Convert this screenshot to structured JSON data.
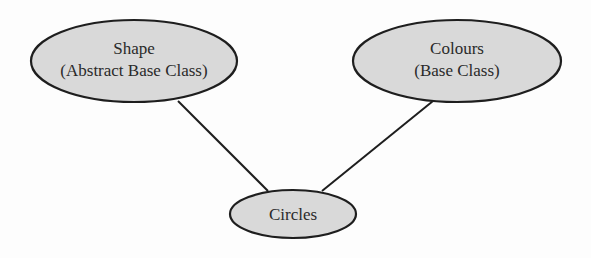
{
  "diagram": {
    "type": "class-inheritance",
    "colors": {
      "background": "#fdfdfd",
      "node_fill": "#d9d9d9",
      "node_stroke": "#1e1e1e",
      "edge": "#1e1e1e",
      "text": "#2a2a2a"
    },
    "nodes": [
      {
        "id": "shape",
        "line1": "Shape",
        "line2": "(Abstract Base Class)",
        "cx": 134,
        "cy": 61,
        "rx": 103,
        "ry": 41
      },
      {
        "id": "colours",
        "line1": "Colours",
        "line2": "(Base Class)",
        "cx": 457,
        "cy": 61,
        "rx": 104,
        "ry": 41
      },
      {
        "id": "circles",
        "line1": "Circles",
        "cx": 293,
        "cy": 214,
        "rx": 63,
        "ry": 24
      }
    ],
    "edges": [
      {
        "from": "shape",
        "to": "circles"
      },
      {
        "from": "colours",
        "to": "circles"
      }
    ]
  }
}
